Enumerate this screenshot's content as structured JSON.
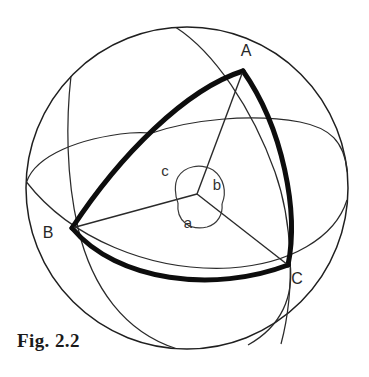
{
  "figure": {
    "caption": "Fig. 2.2",
    "colors": {
      "background": "#ffffff",
      "outline": "#1f1f1f",
      "bold_arc": "#0d0d0d",
      "thin_line": "#2a2a2a",
      "label": "#262626"
    },
    "sphere": {
      "center_x": 187,
      "center_y": 188,
      "radius": 161
    },
    "center_point": {
      "label_name": "sphere-center",
      "x": 197,
      "y": 194
    },
    "vertices": [
      {
        "name": "A",
        "label": "A",
        "x": 243,
        "y": 71,
        "label_x": 246,
        "label_y": 56
      },
      {
        "name": "B",
        "label": "B",
        "x": 72,
        "y": 228,
        "label_x": 48,
        "label_y": 238
      },
      {
        "name": "C",
        "label": "C",
        "x": 288,
        "y": 265,
        "label_x": 297,
        "label_y": 284
      }
    ],
    "central_angles": [
      {
        "name": "a",
        "label": "a",
        "between": "B-O-C",
        "label_x": 188,
        "label_y": 228
      },
      {
        "name": "b",
        "label": "b",
        "between": "A-O-C",
        "label_x": 217,
        "label_y": 190
      },
      {
        "name": "c",
        "label": "c",
        "between": "A-O-B",
        "label_x": 165,
        "label_y": 176
      }
    ],
    "sides": [
      {
        "name": "arc-AB",
        "from": "A",
        "to": "B",
        "style": "bold"
      },
      {
        "name": "arc-BC",
        "from": "B",
        "to": "C",
        "style": "bold"
      },
      {
        "name": "arc-CA",
        "from": "C",
        "to": "A",
        "style": "bold"
      }
    ],
    "radii": [
      {
        "name": "radius-OA",
        "from": "O",
        "to": "A",
        "style": "thin"
      },
      {
        "name": "radius-OB",
        "from": "O",
        "to": "B",
        "style": "thin"
      },
      {
        "name": "radius-OC",
        "from": "O",
        "to": "C",
        "style": "thin"
      }
    ],
    "great_circles": [
      {
        "name": "equator-ellipse",
        "style": "thin"
      },
      {
        "name": "meridian-through-A-C",
        "style": "thin"
      },
      {
        "name": "meridian-through-B-C",
        "style": "thin"
      }
    ]
  }
}
